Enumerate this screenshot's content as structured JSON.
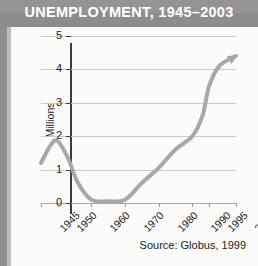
{
  "header": {
    "title": "UNEMPLOYMENT, 1945–2003",
    "bar_color": "#8c8c8a",
    "title_color": "#ffffff"
  },
  "panel": {
    "background": "#fbfbfa",
    "source_note": "Source: Globus, 1999"
  },
  "chart_data": {
    "type": "line",
    "title": "UNEMPLOYMENT, 1945–2003",
    "xlabel": "",
    "ylabel": "Millions",
    "ylim": [
      0,
      5
    ],
    "xlim": [
      1945,
      2003
    ],
    "grid": true,
    "legend": false,
    "line_color": "#a8a8a6",
    "line_width": 4,
    "arrow_end": true,
    "ytick_labels": [
      "5",
      "4",
      "3",
      "2",
      "1",
      "0"
    ],
    "ytick_values": [
      5,
      4,
      3,
      2,
      1,
      0
    ],
    "xtick_labels": [
      "1945",
      "1950",
      "1960",
      "1970",
      "1980",
      "1990",
      "1995",
      "2003"
    ],
    "xtick_values": [
      1945,
      1950,
      1960,
      1970,
      1980,
      1990,
      1995,
      2003
    ],
    "x": [
      1945,
      1948,
      1950,
      1953,
      1956,
      1960,
      1965,
      1970,
      1975,
      1980,
      1985,
      1990,
      1993,
      1995,
      1998,
      2003
    ],
    "values": [
      1.2,
      1.75,
      1.85,
      1.35,
      0.6,
      0.1,
      0.05,
      0.1,
      0.6,
      1.05,
      1.6,
      2.0,
      2.6,
      3.5,
      4.1,
      4.4
    ],
    "series": [
      {
        "name": "Unemployment (millions)",
        "values": [
          1.2,
          1.75,
          1.85,
          1.35,
          0.6,
          0.1,
          0.05,
          0.1,
          0.6,
          1.05,
          1.6,
          2.0,
          2.6,
          3.5,
          4.1,
          4.4
        ]
      }
    ],
    "annotations": [
      "Source: Globus, 1999"
    ]
  }
}
